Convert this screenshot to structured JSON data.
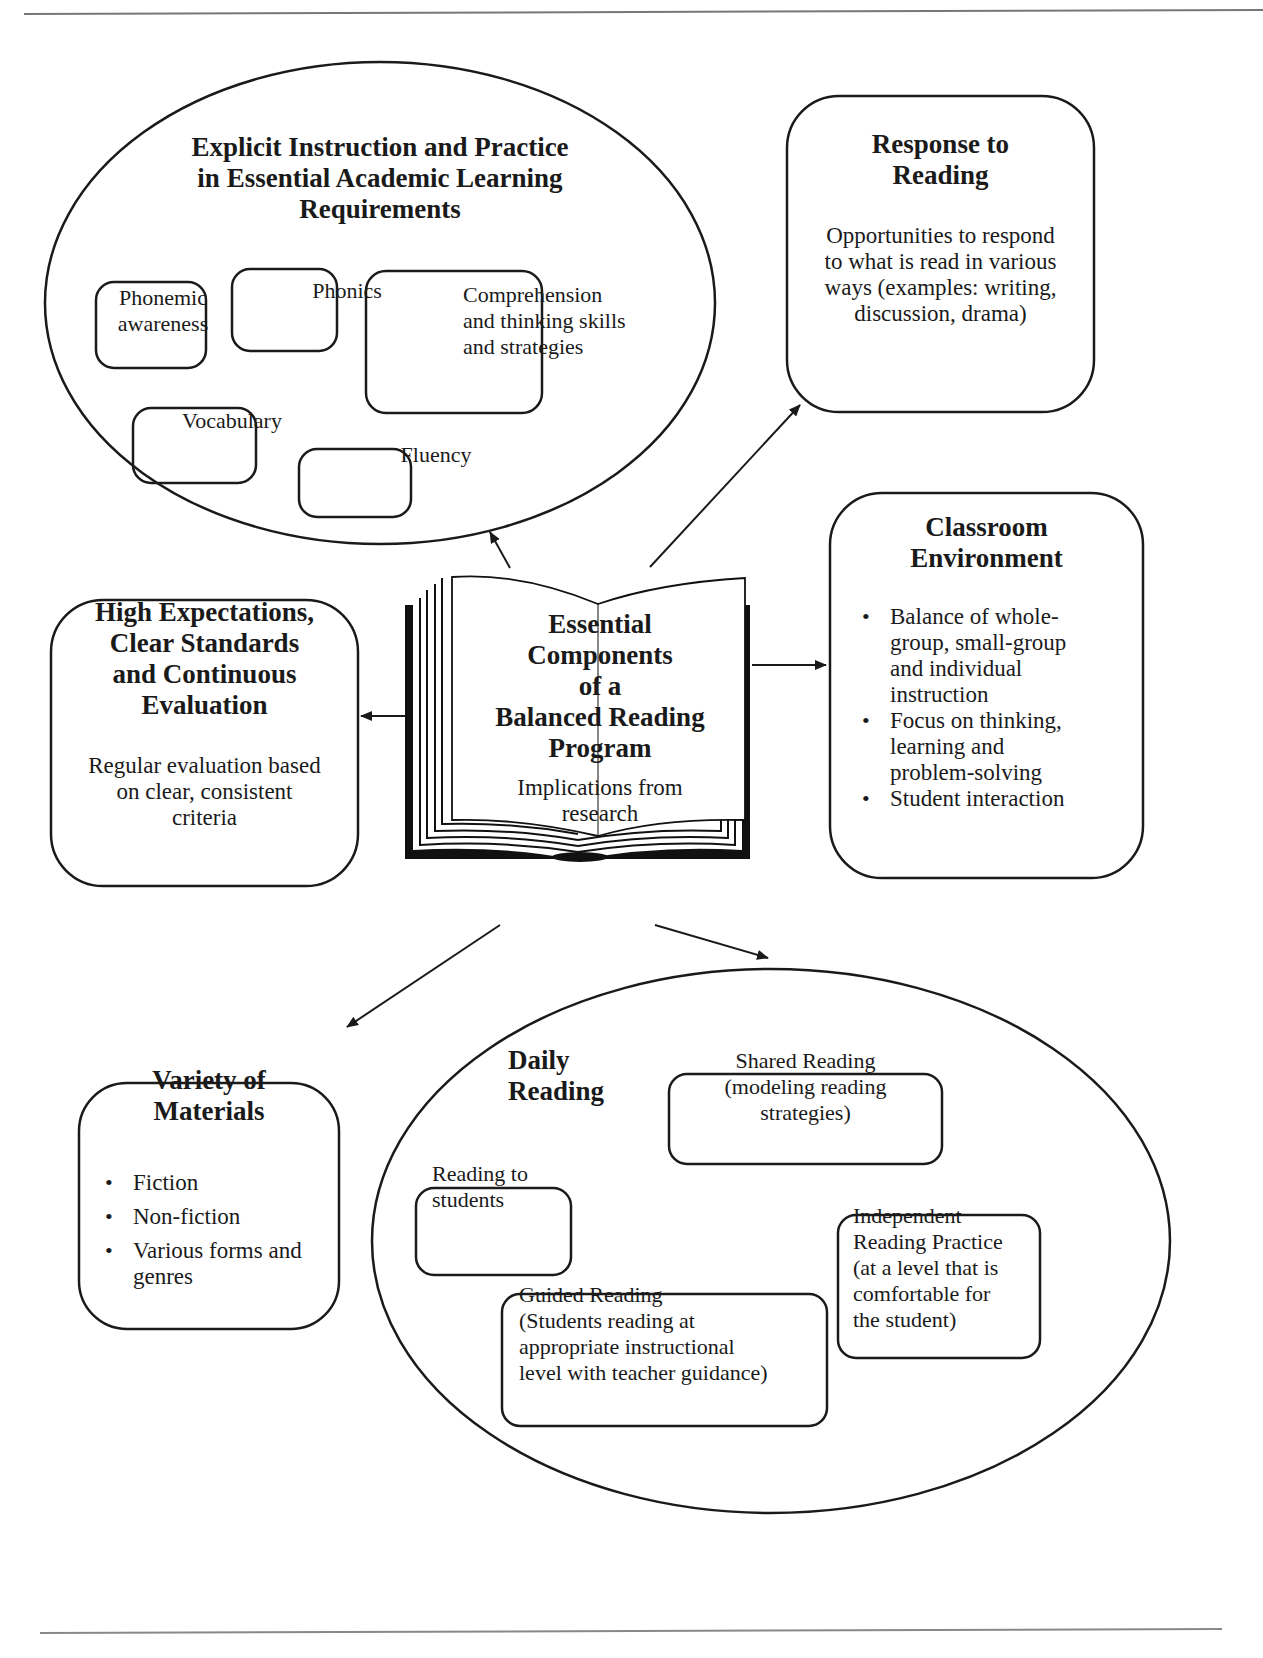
{
  "page": {
    "header_text": "",
    "footer_text": ""
  },
  "center": {
    "title_lines": [
      "Essential",
      "Components",
      "of a",
      "Balanced Reading",
      "Program"
    ],
    "subtitle_lines": [
      "Implications from",
      "research"
    ],
    "icon": "open-book-icon"
  },
  "explicit_instruction": {
    "title_lines": [
      "Explicit Instruction and Practice",
      "in Essential Academic Learning",
      "Requirements"
    ],
    "items": [
      {
        "lines": [
          "Phonemic",
          "awareness"
        ]
      },
      {
        "lines": [
          "Phonics"
        ]
      },
      {
        "lines": [
          "Comprehension",
          "and thinking skills",
          "and strategies"
        ]
      },
      {
        "lines": [
          "Vocabulary"
        ]
      },
      {
        "lines": [
          "Fluency"
        ]
      }
    ]
  },
  "response_to_reading": {
    "title_lines": [
      "Response to",
      "Reading"
    ],
    "body_lines": [
      "Opportunities to respond",
      "to what is read in various",
      "ways (examples: writing,",
      "discussion, drama)"
    ]
  },
  "classroom_environment": {
    "title_lines": [
      "Classroom",
      "Environment"
    ],
    "bullets": [
      [
        "Balance of whole-",
        "group, small-group",
        "and individual",
        "instruction"
      ],
      [
        "Focus on thinking,",
        "learning and",
        "problem-solving"
      ],
      [
        "Student interaction"
      ]
    ]
  },
  "high_expectations": {
    "title_lines": [
      "High Expectations,",
      "Clear Standards",
      "and Continuous",
      "Evaluation"
    ],
    "body_lines": [
      "Regular evaluation based",
      "on clear, consistent",
      "criteria"
    ]
  },
  "variety_of_materials": {
    "title_lines": [
      "Variety of",
      "Materials"
    ],
    "bullets": [
      [
        "Fiction"
      ],
      [
        "Non-fiction"
      ],
      [
        "Various forms and",
        "genres"
      ]
    ]
  },
  "daily_reading": {
    "title_lines": [
      "Daily",
      "Reading"
    ],
    "items": [
      {
        "key": "shared",
        "lines": [
          "Shared Reading",
          "(modeling reading",
          "strategies)"
        ]
      },
      {
        "key": "reading_to",
        "lines": [
          "Reading to",
          "students"
        ]
      },
      {
        "key": "independent",
        "lines": [
          "Independent",
          "Reading Practice",
          "(at a level that is",
          "comfortable for",
          "the student)"
        ]
      },
      {
        "key": "guided",
        "lines": [
          "Guided Reading",
          "(Students reading at",
          "appropriate instructional",
          "level with teacher guidance)"
        ]
      }
    ]
  },
  "colors": {
    "stroke": "#1a1a1a",
    "background": "#ffffff",
    "rule": "#777777"
  }
}
